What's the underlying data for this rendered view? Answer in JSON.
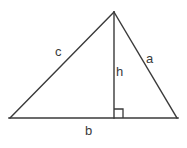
{
  "figure": {
    "stroke_color": "#3a3a3a",
    "background_color": "#ffffff",
    "stroke_width": 1.4,
    "labels": {
      "side_c": "c",
      "side_a": "a",
      "height_h": "h",
      "base_b": "b"
    },
    "geometry": {
      "apex": [
        114,
        12
      ],
      "left_vertex": [
        10,
        118
      ],
      "right_vertex": [
        177,
        118
      ],
      "foot_of_altitude": [
        114,
        118
      ],
      "right_angle_marker_size": 9
    }
  }
}
